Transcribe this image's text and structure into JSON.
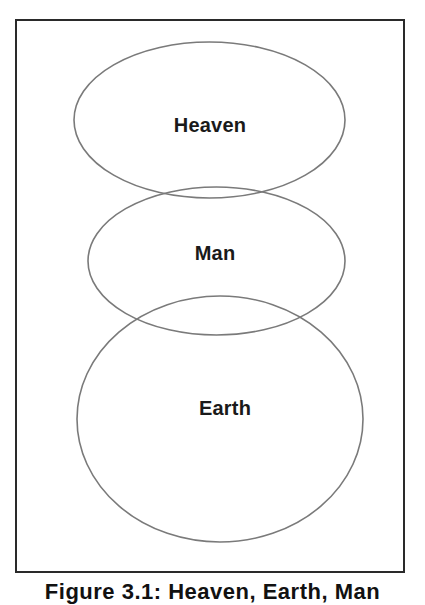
{
  "figure": {
    "colors": {
      "frame": "#2a2a2a",
      "ellipse_stroke": "#7a7a7a",
      "text": "#1a1a1a",
      "background": "#ffffff"
    },
    "ellipses": [
      {
        "id": "heaven",
        "label": "Heaven",
        "cx": 209.5,
        "cy": 120,
        "rx": 135.5,
        "ry": 78
      },
      {
        "id": "man",
        "label": "Man",
        "cx": 216.5,
        "cy": 261,
        "rx": 128.5,
        "ry": 74
      },
      {
        "id": "earth",
        "label": "Earth",
        "cx": 220,
        "cy": 419,
        "rx": 143,
        "ry": 123
      }
    ],
    "caption": "Figure 3.1: Heaven, Earth, Man"
  }
}
